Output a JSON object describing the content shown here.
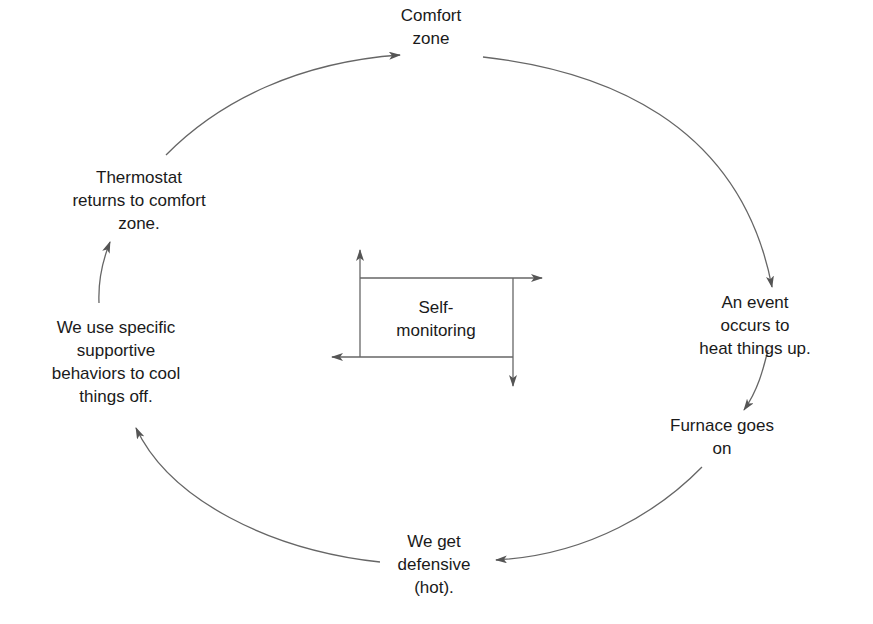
{
  "diagram": {
    "line_color": "#555555",
    "nodes": [
      {
        "id": "comfort-zone",
        "text": "Comfort\nzone",
        "x": 431,
        "y": 4
      },
      {
        "id": "event-heats-up",
        "text": "An event occurs to\nheat things up.",
        "x": 755,
        "y": 291
      },
      {
        "id": "furnace-on",
        "text": "Furnace goes\non",
        "x": 722,
        "y": 414
      },
      {
        "id": "we-get-defensive",
        "text": "We get\ndefensive\n(hot).",
        "x": 434,
        "y": 530
      },
      {
        "id": "supportive-behaviors",
        "text": "We use specific\nsupportive\nbehaviors to cool\nthings off.",
        "x": 116,
        "y": 316
      },
      {
        "id": "thermostat-returns",
        "text": "Thermostat\nreturns to comfort\nzone.",
        "x": 139,
        "y": 166
      }
    ],
    "center": {
      "id": "self-monitoring",
      "text": "Self-\nmonitoring",
      "x": 436,
      "y": 296
    },
    "edges": [
      {
        "from": "comfort-zone",
        "to": "event-heats-up"
      },
      {
        "from": "event-heats-up",
        "to": "furnace-on"
      },
      {
        "from": "furnace-on",
        "to": "we-get-defensive"
      },
      {
        "from": "we-get-defensive",
        "to": "supportive-behaviors"
      },
      {
        "from": "supportive-behaviors",
        "to": "thermostat-returns"
      },
      {
        "from": "thermostat-returns",
        "to": "comfort-zone"
      }
    ]
  }
}
